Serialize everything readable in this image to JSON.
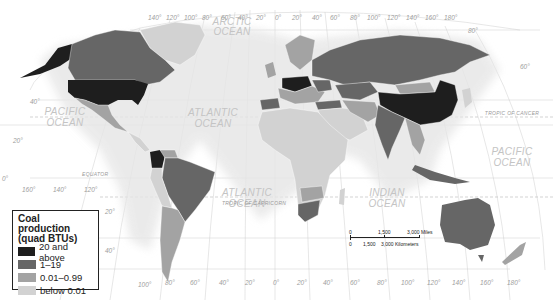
{
  "map": {
    "title": "World coal production",
    "colors": {
      "level_20_above": "#1e1e1e",
      "level_1_19": "#666666",
      "level_001_099": "#a3a3a3",
      "level_below_001": "#d2d2d2",
      "ocean": "#ffffff",
      "graticule": "#c8c8c8"
    },
    "oceans": {
      "arctic": [
        "ARCTIC",
        "OCEAN"
      ],
      "pacific_west": [
        "PACIFIC",
        "OCEAN"
      ],
      "pacific_east": [
        "PACIFIC",
        "OCEAN"
      ],
      "atlantic_north": [
        "ATLANTIC",
        "OCEAN"
      ],
      "atlantic_south": [
        "ATLANTIC",
        "OCEAN"
      ],
      "indian": [
        "INDIAN",
        "OCEAN"
      ]
    },
    "lines": {
      "equator": "EQUATOR",
      "tropic_cancer": "TROPIC OF CANCER",
      "tropic_capricorn": "TROPIC OF CAPRICORN"
    },
    "latitude_labels": [
      "80°",
      "60°",
      "40°",
      "20°",
      "0°",
      "20°",
      "40°"
    ],
    "longitude_labels_top": [
      "140°",
      "120°",
      "100°",
      "80°",
      "60°",
      "40°",
      "20°",
      "0°",
      "20°",
      "40°",
      "60°",
      "80°",
      "100°",
      "120°",
      "140°",
      "160°",
      "180°"
    ],
    "longitude_labels_bottom": [
      "100°",
      "80°",
      "60°",
      "40°",
      "20°",
      "0°",
      "20°",
      "40°",
      "60°",
      "80°",
      "100°",
      "120°",
      "140°",
      "160°",
      "180°"
    ],
    "longitude_labels_left": [
      "160°",
      "140°",
      "120°"
    ],
    "country_levels": {
      "20_and_above": [
        "United States",
        "China"
      ],
      "1_19": [
        "Canada",
        "Russia",
        "Kazakhstan",
        "Poland",
        "Germany",
        "Ukraine",
        "India",
        "Indonesia",
        "Australia",
        "South Africa",
        "Colombia",
        "Brazil",
        "Mongolia",
        "Turkey"
      ],
      "0.01_0.99": [
        "Mexico",
        "Venezuela",
        "Argentina",
        "Chile",
        "Spain",
        "Iran",
        "Pakistan",
        "Vietnam",
        "Zimbabwe",
        "Botswana",
        "Mozambique",
        "Norway",
        "New Zealand"
      ],
      "below_0.01": [
        "Greenland",
        "Africa (most countries)",
        "Saudi Arabia",
        "Peru",
        "Bolivia",
        "Madagascar"
      ]
    }
  },
  "legend": {
    "title_line1": "Coal production",
    "title_line2": "(quad BTUs)",
    "items": [
      {
        "label": "20 and above",
        "color": "#1e1e1e"
      },
      {
        "label": "1–19",
        "color": "#666666"
      },
      {
        "label": "0.01–0.99",
        "color": "#a3a3a3"
      },
      {
        "label": "below 0.01",
        "color": "#d2d2d2"
      }
    ]
  },
  "scale_bar": {
    "miles_0": "0",
    "miles_mid": "1,500",
    "miles_end": "3,000 Miles",
    "km_0": "0",
    "km_mid": "1,500",
    "km_end": "3,000 Kilometers"
  }
}
